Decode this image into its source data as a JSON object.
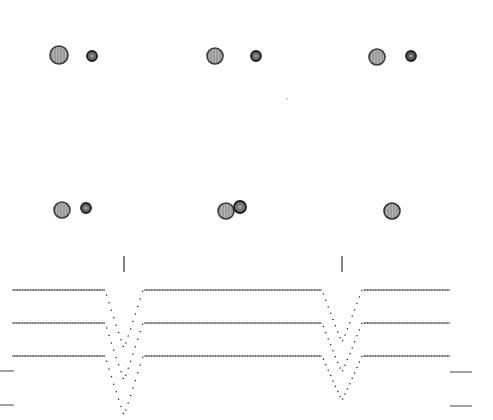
{
  "figure": {
    "width": 493,
    "height": 420,
    "background": "#ffffff"
  },
  "panels": [
    {
      "id": "frame-top-1",
      "bodies": [
        {
          "role": "star",
          "cx": 59,
          "cy": 55,
          "r": 9,
          "fill": "#a8a8a8",
          "stroke": "#3a3a3a"
        },
        {
          "role": "planet",
          "cx": 92,
          "cy": 56,
          "r": 5,
          "fill": "#666666",
          "stroke": "#1e1e1e"
        }
      ]
    },
    {
      "id": "frame-top-2",
      "bodies": [
        {
          "role": "star",
          "cx": 215,
          "cy": 56,
          "r": 8,
          "fill": "#a8a8a8",
          "stroke": "#3a3a3a"
        },
        {
          "role": "planet",
          "cx": 256,
          "cy": 56,
          "r": 5,
          "fill": "#666666",
          "stroke": "#1e1e1e"
        }
      ]
    },
    {
      "id": "frame-top-3",
      "bodies": [
        {
          "role": "star",
          "cx": 377,
          "cy": 57,
          "r": 8,
          "fill": "#a8a8a8",
          "stroke": "#3a3a3a"
        },
        {
          "role": "planet",
          "cx": 411,
          "cy": 56,
          "r": 5,
          "fill": "#555555",
          "stroke": "#1e1e1e"
        }
      ]
    },
    {
      "id": "frame-bottom-1",
      "bodies": [
        {
          "role": "star",
          "cx": 62,
          "cy": 210,
          "r": 8,
          "fill": "#a8a8a8",
          "stroke": "#3a3a3a"
        },
        {
          "role": "planet",
          "cx": 86,
          "cy": 208,
          "r": 5,
          "fill": "#666666",
          "stroke": "#1e1e1e"
        }
      ]
    },
    {
      "id": "frame-bottom-2",
      "bodies": [
        {
          "role": "star",
          "cx": 226,
          "cy": 211,
          "r": 8,
          "fill": "#a8a8a8",
          "stroke": "#3a3a3a"
        },
        {
          "role": "planet",
          "cx": 240,
          "cy": 207,
          "r": 6,
          "fill": "#777777",
          "stroke": "#1e1e1e"
        }
      ]
    },
    {
      "id": "frame-bottom-3",
      "bodies": [
        {
          "role": "star",
          "cx": 392,
          "cy": 211,
          "r": 8,
          "fill": "#a0a0a0",
          "stroke": "#2e2e2e"
        }
      ]
    }
  ],
  "speck": {
    "cx": 287,
    "cy": 99,
    "r": 0.8,
    "fill": "#999999"
  },
  "chart_data": {
    "type": "line",
    "title": "",
    "xlabel": "",
    "ylabel": "",
    "grid": false,
    "legend": null,
    "style": "dotted",
    "x_range_px": [
      13,
      450
    ],
    "transit_markers": [
      {
        "x": 124,
        "y1": 256,
        "y2": 272
      },
      {
        "x": 342,
        "y1": 256,
        "y2": 272
      }
    ],
    "side_markers": {
      "left": [
        {
          "x1": 0,
          "x2": 14,
          "y": 371
        },
        {
          "x1": 0,
          "x2": 14,
          "y": 405
        }
      ],
      "right": [
        {
          "x1": 450,
          "x2": 472,
          "y": 372
        },
        {
          "x1": 450,
          "x2": 472,
          "y": 406
        }
      ]
    },
    "series": [
      {
        "name": "light-curve-1",
        "baseline_y": 290,
        "transits": [
          {
            "start_x": 105,
            "center_x": 124,
            "end_x": 143,
            "depth": 58
          },
          {
            "start_x": 322,
            "center_x": 342,
            "end_x": 362,
            "depth": 52
          }
        ]
      },
      {
        "name": "light-curve-2",
        "baseline_y": 323,
        "transits": [
          {
            "start_x": 105,
            "center_x": 124,
            "end_x": 143,
            "depth": 57
          },
          {
            "start_x": 322,
            "center_x": 342,
            "end_x": 362,
            "depth": 49
          }
        ]
      },
      {
        "name": "light-curve-3",
        "baseline_y": 356,
        "transits": [
          {
            "start_x": 105,
            "center_x": 124,
            "end_x": 143,
            "depth": 59
          },
          {
            "start_x": 322,
            "center_x": 342,
            "end_x": 362,
            "depth": 44
          }
        ]
      }
    ],
    "dot_spacing": 2.5,
    "dot_color": "#222222"
  }
}
